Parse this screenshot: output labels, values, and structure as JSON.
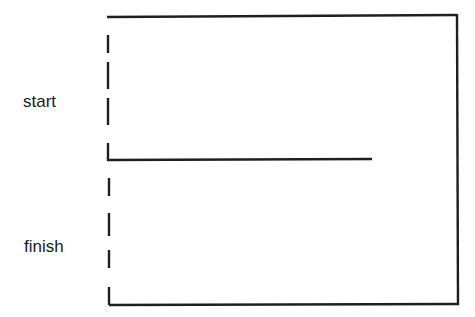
{
  "diagram": {
    "type": "timeline-bracket",
    "stroke_color": "#1f1f1f",
    "background": "#ffffff",
    "labels": {
      "start": "start",
      "finish": "finish"
    },
    "segments": [
      {
        "id": "top-line",
        "x1": 107,
        "y1": 17,
        "x2": 457,
        "y2": 15
      },
      {
        "id": "right-line",
        "x1": 457,
        "y1": 15,
        "x2": 458,
        "y2": 304
      },
      {
        "id": "middle-line",
        "x1": 108,
        "y1": 160,
        "x2": 372,
        "y2": 159
      },
      {
        "id": "bottom-line",
        "x1": 109,
        "y1": 305,
        "x2": 458,
        "y2": 304
      }
    ],
    "dashed_axis": {
      "x": 108,
      "dashes_upper": [
        [
          35,
          53
        ],
        [
          62,
          89
        ],
        [
          98,
          125
        ],
        [
          143,
          160
        ]
      ],
      "dashes_lower": [
        [
          178,
          196
        ],
        [
          213,
          236
        ],
        [
          250,
          268
        ],
        [
          287,
          305
        ]
      ]
    }
  }
}
